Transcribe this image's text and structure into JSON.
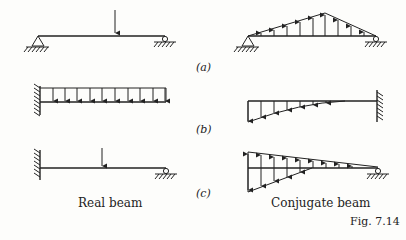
{
  "figure": {
    "number_label": "Fig. 7.14",
    "column_labels": {
      "left": "Real beam",
      "right": "Conjugate beam"
    },
    "rows": [
      {
        "label": "(a)",
        "real": "simply supported beam, pin left, roller right, point load near 60% span",
        "conjugate": "simply supported, triangular upward distributed load peaking under load point"
      },
      {
        "label": "(b)",
        "real": "cantilever fixed at left with uniform downward distributed load",
        "conjugate": "free left, fixed right, parabolic downward load increasing to left"
      },
      {
        "label": "(c)",
        "real": "propped cantilever, fixed left, roller right, point load",
        "conjugate": "free left, roller right, mixed up/down triangular loads"
      }
    ]
  }
}
